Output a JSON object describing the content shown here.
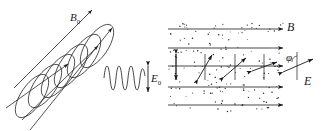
{
  "figure": {
    "stroke_color": "#1a1a1a",
    "dot_color": "#2b2b2b",
    "background": "#ffffff",
    "width": 333,
    "height": 131
  },
  "left_panel": {
    "name": "incident-circularly-polarized-wave",
    "helix": {
      "turns": 5,
      "axis_angle_deg": -35,
      "description": "helical coil representing rotating field vector"
    },
    "propagation_arrows": {
      "count": 3,
      "direction_deg": -35,
      "label": "B₀"
    },
    "labels": {
      "b0": "B",
      "b0_sub": "0",
      "e0": "E",
      "e0_sub": "0"
    },
    "sine_wave": {
      "cycles": 4,
      "amplitude": 11,
      "orientation": "vertical-transverse"
    },
    "amplitude_marker": {
      "type": "double-headed-arrow",
      "orientation": "vertical",
      "label": "E₀"
    }
  },
  "right_panel": {
    "name": "medium-with-rotating-polarization",
    "medium": {
      "fill": "scattered-dots",
      "dot_count": 150,
      "description": "optically active medium / particle suspension"
    },
    "field_lines": {
      "count": 5,
      "direction": "left-to-right",
      "label": "B",
      "y_positions": [
        29,
        48,
        66,
        87,
        105
      ]
    },
    "polarization_vectors": [
      {
        "x": 176,
        "angle_deg": 0,
        "label": "E-vector-1"
      },
      {
        "x": 205,
        "angle_deg": 28,
        "label": "E-vector-2"
      },
      {
        "x": 235,
        "angle_deg": 55,
        "label": "E-vector-3"
      },
      {
        "x": 264,
        "angle_deg": 78,
        "label": "E-vector-4"
      }
    ],
    "angle_detail": {
      "symbol": "φ",
      "description": "rotation angle between reference axis and E vector",
      "reference_axis": "vertical",
      "vector_label": "E"
    },
    "labels": {
      "b": "B",
      "e": "E",
      "phi": "φ"
    }
  }
}
